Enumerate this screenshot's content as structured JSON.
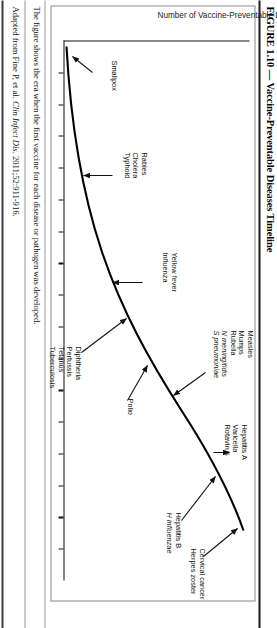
{
  "figure": {
    "title": "FIGURE 1.10 — Vaccine-Preventable Diseases Timeline",
    "caption_line1": "The figure shows the era when the first vaccine for each disease or pathogen was developed.",
    "caption_source_prefix": "Adapted from Fine P, et al. ",
    "caption_source_italic": "Clin Infect Dis",
    "caption_source_suffix": ". 2011;52:911-916."
  },
  "axes": {
    "y_label": "Number of Vaccine-Preventable Diseases",
    "x_label": "",
    "tick_count": 16
  },
  "annotations": [
    {
      "id": "smallpox",
      "labels": [
        "Smallpox"
      ]
    },
    {
      "id": "rabies-group",
      "labels": [
        "Rabies",
        "Cholera",
        "Typhoid"
      ]
    },
    {
      "id": "yellowfever",
      "labels": [
        "Yellow fever",
        "Influenza"
      ]
    },
    {
      "id": "diphtheria",
      "labels": [
        "Diphtheria",
        "Pertussis",
        "Tetanus",
        "Tuberculosis"
      ]
    },
    {
      "id": "measles-group",
      "labels": [
        "Measles",
        "Mumps",
        "Rubella",
        "N meningitidis",
        "S pneumoniae"
      ]
    },
    {
      "id": "polio",
      "labels": [
        "Polio"
      ]
    },
    {
      "id": "hepatitis-a",
      "labels": [
        "Hepatitis A",
        "Varicella",
        "Rotavirus"
      ]
    },
    {
      "id": "hepatitis-b",
      "labels": [
        "Hepatitis B",
        "H influenzae"
      ]
    },
    {
      "id": "cervical",
      "labels": [
        "Cervical cancer",
        "Herpes zoster"
      ]
    }
  ],
  "chart_data": {
    "type": "line",
    "title": "Vaccine-Preventable Diseases Timeline",
    "xlabel": "",
    "ylabel": "Number of Vaccine-Preventable Diseases",
    "grid": false,
    "legend": "none",
    "x": [
      0,
      10,
      20,
      30,
      40,
      50,
      60,
      70,
      80,
      90,
      100
    ],
    "y": [
      0,
      1,
      3,
      6,
      10,
      15,
      20,
      25,
      29,
      32,
      34
    ],
    "annotation_points": [
      {
        "label": "Smallpox",
        "x": 3,
        "y": 1
      },
      {
        "label": "Rabies / Cholera / Typhoid",
        "x": 22,
        "y": 4
      },
      {
        "label": "Yellow fever / Influenza",
        "x": 40,
        "y": 10
      },
      {
        "label": "Diphtheria / Pertussis / Tetanus / Tuberculosis",
        "x": 47,
        "y": 13
      },
      {
        "label": "Measles / Mumps / Rubella / N meningitidis / S pneumoniae",
        "x": 60,
        "y": 20
      },
      {
        "label": "Polio",
        "x": 56,
        "y": 18
      },
      {
        "label": "Hepatitis A / Varicella / Rotavirus",
        "x": 78,
        "y": 28
      },
      {
        "label": "Hepatitis B / H influenzae",
        "x": 86,
        "y": 31
      },
      {
        "label": "Cervical cancer / Herpes zoster",
        "x": 97,
        "y": 34
      }
    ]
  },
  "colors": {
    "curve": "#000000",
    "frame": "#8a8a8a",
    "text": "#111111"
  }
}
